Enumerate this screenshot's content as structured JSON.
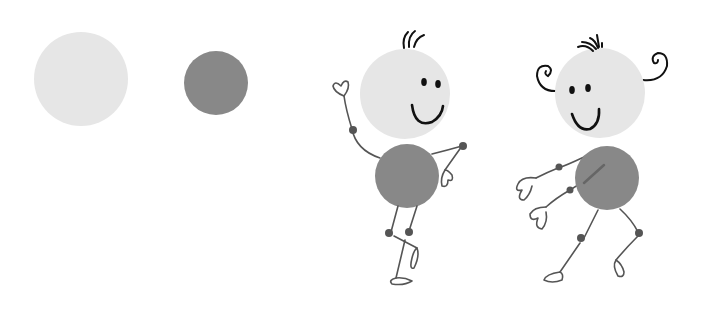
{
  "colors": {
    "background": "#ffffff",
    "light_circle": "#e6e6e6",
    "dark_circle": "#888888",
    "joint": "#555555",
    "ink": "#111111",
    "limb": "#555555"
  },
  "shapes": {
    "light_circle": {
      "cx": 81,
      "cy": 79,
      "r": 47
    },
    "dark_circle": {
      "cx": 216,
      "cy": 83,
      "r": 32
    }
  },
  "figures": [
    {
      "name": "figure-waving",
      "head": {
        "cx": 405,
        "cy": 94,
        "r": 45
      },
      "body": {
        "cx": 407,
        "cy": 176,
        "r": 32
      }
    },
    {
      "name": "figure-curly",
      "head": {
        "cx": 600,
        "cy": 93,
        "r": 45
      },
      "body": {
        "cx": 607,
        "cy": 178,
        "r": 32
      }
    }
  ]
}
